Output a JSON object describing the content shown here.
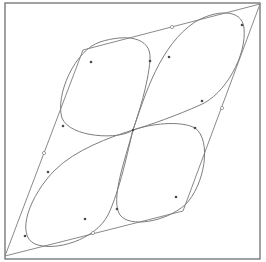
{
  "diagram": {
    "type": "geometric-curve-construction",
    "colors": {
      "background": "#ffffff",
      "frame": "#6f6f6f",
      "polygon": "#8a8a8a",
      "curve": "#7e7e7e",
      "point": "#4a4a4a"
    },
    "frame": {
      "x": 5,
      "y": 3,
      "width": 255,
      "height": 256
    },
    "polygon": {
      "vertices": [
        {
          "name": "top-right",
          "x": 260,
          "y": 4
        },
        {
          "name": "top-left",
          "x": 83,
          "y": 50
        },
        {
          "name": "bottom-left",
          "x": 5,
          "y": 256
        },
        {
          "name": "bottom-right",
          "x": 183,
          "y": 211
        }
      ]
    },
    "center": {
      "x": 133,
      "y": 130
    },
    "edge_markers": [
      {
        "x": 172,
        "y": 27
      },
      {
        "x": 44,
        "y": 153
      },
      {
        "x": 93,
        "y": 233
      },
      {
        "x": 222,
        "y": 108
      }
    ],
    "curve_points": [
      {
        "x": 91,
        "y": 62
      },
      {
        "x": 150,
        "y": 61
      },
      {
        "x": 63,
        "y": 126
      },
      {
        "x": 169,
        "y": 57
      },
      {
        "x": 242,
        "y": 25
      },
      {
        "x": 202,
        "y": 101
      },
      {
        "x": 48,
        "y": 172
      },
      {
        "x": 25,
        "y": 236
      },
      {
        "x": 85,
        "y": 219
      },
      {
        "x": 195,
        "y": 128
      },
      {
        "x": 176,
        "y": 197
      },
      {
        "x": 117,
        "y": 209
      },
      {
        "x": 133,
        "y": 130
      }
    ],
    "lobes": [
      {
        "name": "upper-left",
        "path": "M133,130 C120,140 70,138 62,118 C55,95 75,50 100,42 C125,34 152,36 150,60 C148,85 138,115 133,130"
      },
      {
        "name": "upper-right",
        "path": "M133,130 C145,95 160,45 195,22 C215,10 242,8 244,28 C247,55 225,95 200,105 C178,115 150,125 133,130"
      },
      {
        "name": "lower-left",
        "path": "M133,130 C110,137 75,150 55,170 C30,195 15,235 35,244 C55,252 95,240 108,215 C120,190 128,150 133,130"
      },
      {
        "name": "lower-right",
        "path": "M133,130 C150,124 180,120 195,128 C212,140 205,185 185,205 C165,222 130,228 120,215 C110,200 125,160 133,130"
      }
    ]
  }
}
